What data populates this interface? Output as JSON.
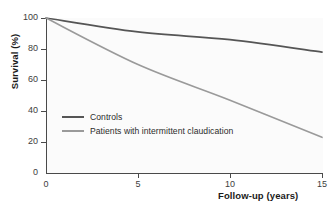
{
  "chart_data": {
    "type": "line",
    "title": "",
    "xlabel": "Follow-up (years)",
    "ylabel": "Survival (%)",
    "xlim": [
      0,
      15
    ],
    "ylim": [
      0,
      100
    ],
    "xticks": [
      "0",
      "5",
      "10",
      "15"
    ],
    "yticks": [
      "0",
      "20",
      "40",
      "60",
      "80",
      "100"
    ],
    "grid": false,
    "legend_position": "inside-lower-left",
    "x": [
      0,
      5,
      10,
      15
    ],
    "series": [
      {
        "name": "Controls",
        "color": "#555555",
        "values": [
          100,
          91,
          86,
          78
        ]
      },
      {
        "name": "Patients with intermittent claudication",
        "color": "#9a9a9a",
        "values": [
          100,
          70,
          47,
          23
        ]
      }
    ]
  },
  "legend": {
    "items": [
      {
        "label": "Controls"
      },
      {
        "label": "Patients with intermittent claudication"
      }
    ]
  },
  "colors": {
    "axis": "#4a4a4a",
    "text": "#1a1a1a",
    "tick_text": "#3d3d3d",
    "plot_background": "#fbfbfb",
    "page_background": "#ffffff"
  }
}
